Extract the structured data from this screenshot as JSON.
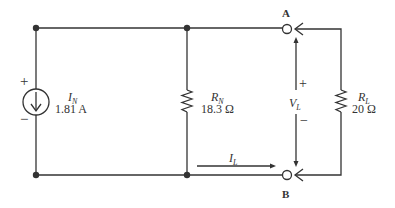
{
  "diagram": {
    "type": "Norton equivalent circuit with load",
    "source": {
      "symbol": "I",
      "subscript": "N",
      "value": "1.81 A",
      "plus": "+",
      "minus": "−"
    },
    "norton_resistor": {
      "symbol": "R",
      "subscript": "N",
      "value": "18.3 Ω"
    },
    "load_resistor": {
      "symbol": "R",
      "subscript": "L",
      "value": "20 Ω"
    },
    "load_voltage": {
      "symbol": "V",
      "subscript": "L",
      "plus": "+",
      "minus": "−"
    },
    "load_current": {
      "symbol": "I",
      "subscript": "L"
    },
    "terminals": {
      "top": "A",
      "bottom": "B"
    },
    "colors": {
      "wire": "#333333",
      "background": "#ffffff"
    }
  }
}
